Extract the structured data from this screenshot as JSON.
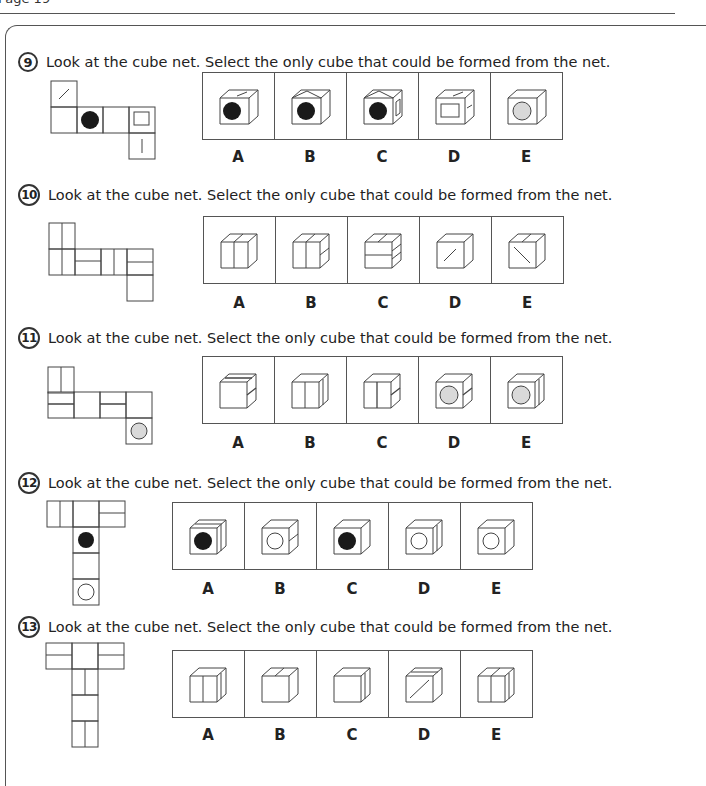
{
  "page": {
    "label": "Page 19"
  },
  "colors": {
    "line": "#444444",
    "black_dot": "#1a1a1a",
    "grey_dot": "#d9d9d9"
  },
  "instruction": "Look at the cube net. Select the only cube that could be formed from the net.",
  "questions": [
    {
      "number": "9",
      "text": "Look at the cube net. Select the only cube that could be formed from the net.",
      "net_faces": [
        "diagonal-line",
        "blank",
        "black-circle",
        "blank",
        "square-outline",
        "vertical-line"
      ],
      "options": [
        {
          "label": "A",
          "front": "black-circle",
          "top": "diagonal-line",
          "side": "blank"
        },
        {
          "label": "B",
          "front": "black-circle",
          "top": "roof-lines",
          "side": "blank"
        },
        {
          "label": "C",
          "front": "black-circle",
          "top": "roof-lines",
          "side": "square-outline"
        },
        {
          "label": "D",
          "front": "square-outline",
          "top": "diagonal-line",
          "side": "short-line"
        },
        {
          "label": "E",
          "front": "grey-circle",
          "top": "blank",
          "side": "blank"
        }
      ]
    },
    {
      "number": "10",
      "text": "Look at the cube net. Select the only cube that could be formed from the net.",
      "net_faces": [
        "vertical-split",
        "vertical-split",
        "horizontal-split",
        "vertical-split",
        "horizontal-split",
        "blank"
      ],
      "options": [
        {
          "label": "A",
          "front": "vertical-split",
          "top": "split",
          "side": "blank"
        },
        {
          "label": "B",
          "front": "vertical-split",
          "top": "split",
          "side": "horizontal-split"
        },
        {
          "label": "C",
          "front": "horizontal-split",
          "top": "split",
          "side": "horizontal-split"
        },
        {
          "label": "D",
          "front": "diagonal-line",
          "top": "blank",
          "side": "blank"
        },
        {
          "label": "E",
          "front": "diagonal-line-reverse",
          "top": "split",
          "side": "blank"
        }
      ]
    },
    {
      "number": "11",
      "text": "Look at the cube net. Select the only cube that could be formed from the net.",
      "net_faces": [
        "vertical-split",
        "horizontal-split",
        "blank",
        "horizontal-split",
        "blank",
        "grey-circle"
      ],
      "options": [
        {
          "label": "A",
          "front": "blank",
          "top": "split",
          "side": "horizontal-split"
        },
        {
          "label": "B",
          "front": "vertical-split",
          "top": "blank",
          "side": "vertical-split"
        },
        {
          "label": "C",
          "front": "vertical-split",
          "top": "blank",
          "side": "horizontal-split"
        },
        {
          "label": "D",
          "front": "grey-circle",
          "top": "blank",
          "side": "horizontal-split"
        },
        {
          "label": "E",
          "front": "grey-circle",
          "top": "blank",
          "side": "vertical-split"
        }
      ]
    },
    {
      "number": "12",
      "text": "Look at the cube net. Select the only cube that could be formed from the net.",
      "net_faces": [
        "vertical-split",
        "blank",
        "horizontal-split",
        "black-circle",
        "blank",
        "white-circle"
      ],
      "options": [
        {
          "label": "A",
          "front": "black-circle",
          "top": "split",
          "side": "vertical-split"
        },
        {
          "label": "B",
          "front": "white-circle",
          "top": "blank",
          "side": "horizontal-split"
        },
        {
          "label": "C",
          "front": "black-circle",
          "top": "blank",
          "side": "blank"
        },
        {
          "label": "D",
          "front": "white-circle",
          "top": "blank",
          "side": "vertical-split"
        },
        {
          "label": "E",
          "front": "white-circle",
          "top": "blank",
          "side": "blank"
        }
      ]
    },
    {
      "number": "13",
      "text": "Look at the cube net. Select the only cube that could be formed from the net.",
      "net_faces": [
        "horizontal-split",
        "blank",
        "horizontal-split",
        "vertical-split",
        "blank",
        "vertical-split"
      ],
      "options": [
        {
          "label": "A",
          "front": "vertical-split",
          "top": "blank",
          "side": "vertical-split"
        },
        {
          "label": "B",
          "front": "blank",
          "top": "split",
          "side": "blank"
        },
        {
          "label": "C",
          "front": "blank",
          "top": "blank",
          "side": "vertical-split"
        },
        {
          "label": "D",
          "front": "diagonal-line",
          "top": "blank",
          "side": "blank"
        },
        {
          "label": "E",
          "front": "vertical-split",
          "top": "split",
          "side": "vertical-split"
        }
      ]
    }
  ]
}
